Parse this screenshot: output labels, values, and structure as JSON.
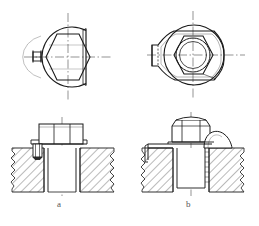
{
  "drawing": {
    "title": "Bolt locking arrangements",
    "sheet_background": "#ffffff",
    "line_color": "#1a1a1a",
    "hatch_color": "#333333",
    "centerline_color": "#444444",
    "caption_color": "#555555",
    "figure_count": 2
  },
  "captions": {
    "left": "a",
    "right": "b"
  },
  "views": [
    {
      "id": "top-left-plan",
      "name": "plan-view-a",
      "description": "Hexagon nut inside circular recess with flat milled on right side and small key tab on left",
      "label": "",
      "center_x": 68,
      "center_y": 57,
      "circle_radius": 30,
      "hex_across_flats": 44
    },
    {
      "id": "top-right-plan",
      "name": "plan-view-b",
      "description": "Hexagon nut with circular washer and bent locking tab projecting to the left",
      "label": "",
      "center_x": 193,
      "center_y": 55,
      "circle_radius": 30,
      "hex_across_flats": 40,
      "inner_circle_radius": 17
    },
    {
      "id": "bottom-left-section",
      "name": "section-view-a",
      "description": "Sectional view: hex bolt head seated on hatched housing, locking pin driven into counterbore at left",
      "label": "a",
      "center_x": 62,
      "center_y": 160
    },
    {
      "id": "bottom-right-section",
      "name": "section-view-b",
      "description": "Sectional view: hex nut on stud with tab washer bent up against the housing wall at left and domed boss at right",
      "label": "b",
      "center_x": 191,
      "center_y": 160
    }
  ],
  "annotations": {
    "hatch_spacing_px": 6,
    "hatch_angle_deg": 45,
    "break_line_style": "freehand-zigzag",
    "hidden_line_style": "dashed",
    "center_line_style": "dash-dot"
  }
}
